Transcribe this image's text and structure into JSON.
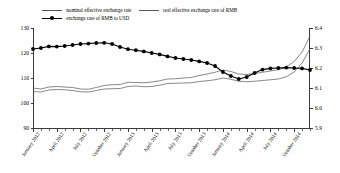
{
  "legend": {
    "items": [
      {
        "label": "nominal effective exchange rate",
        "style": "line",
        "color": "#555555"
      },
      {
        "label": "real effective exchange rate of RMB",
        "style": "line",
        "color": "#555555"
      },
      {
        "label": "exchange rate of RMB to USD",
        "style": "line-marker",
        "color": "#000000"
      }
    ]
  },
  "chart_data": {
    "type": "line",
    "title": "",
    "xlabel": "",
    "ylabel": "",
    "grid": false,
    "legend_position": "top",
    "x": [
      "January 2012",
      "February 2012",
      "March 2012",
      "April 2012",
      "May 2012",
      "June 2012",
      "July 2012",
      "August 2012",
      "September 2012",
      "October 2012",
      "November 2012",
      "December 2012",
      "January 2013",
      "February 2013",
      "March 2013",
      "April 2013",
      "May 2013",
      "June 2013",
      "July 2013",
      "August 2013",
      "September 2013",
      "October 2013",
      "November 2013",
      "December 2013",
      "January 2014",
      "February 2014",
      "March 2014",
      "April 2014",
      "May 2014",
      "June 2014",
      "July 2014",
      "August 2014",
      "September 2014",
      "October 2014",
      "November 2014",
      "December 2014"
    ],
    "xticklabels": [
      "January 2012",
      "April 2012",
      "July 2012",
      "October 2012",
      "January 2013",
      "April 2013",
      "July 2013",
      "October 2013",
      "January 2014",
      "April 2014",
      "July 2014",
      "October 2014"
    ],
    "left_axis": {
      "label": "",
      "ylim": [
        90,
        130
      ],
      "ticks": [
        90,
        100,
        110,
        120,
        130
      ],
      "ticklabels": [
        "90",
        "100",
        "110",
        "120",
        "130"
      ]
    },
    "right_axis": {
      "label": "",
      "ylim": [
        5.9,
        6.4
      ],
      "ticks": [
        5.9,
        6.0,
        6.1,
        6.2,
        6.3,
        6.4
      ],
      "ticklabels": [
        "5.9",
        "6.0",
        "6.1",
        "6.2",
        "6.3",
        "6.4"
      ]
    },
    "series": [
      {
        "name": "nominal effective exchange rate",
        "axis": "left",
        "color": "#555555",
        "marker": "none",
        "values": [
          106.0,
          105.6,
          106.4,
          106.6,
          106.4,
          106.2,
          105.6,
          105.5,
          106.2,
          107.0,
          107.3,
          107.4,
          108.3,
          108.2,
          108.1,
          108.4,
          108.9,
          109.6,
          109.7,
          110.0,
          110.2,
          111.0,
          111.6,
          112.3,
          113.2,
          112.6,
          111.6,
          111.4,
          111.8,
          112.3,
          112.8,
          113.3,
          114.4,
          116.6,
          120.4,
          126.8
        ]
      },
      {
        "name": "real effective exchange rate of RMB",
        "axis": "left",
        "color": "#555555",
        "marker": "none",
        "values": [
          104.6,
          104.4,
          105.2,
          105.4,
          105.3,
          105.0,
          104.5,
          104.4,
          105.0,
          105.6,
          105.7,
          105.8,
          106.6,
          106.8,
          106.5,
          106.6,
          107.1,
          107.8,
          107.9,
          108.0,
          108.1,
          108.6,
          108.9,
          109.3,
          110.0,
          109.5,
          108.7,
          108.5,
          108.7,
          109.0,
          109.3,
          109.6,
          110.5,
          112.4,
          116.0,
          121.8
        ]
      },
      {
        "name": "exchange rate of RMB to USD",
        "axis": "right",
        "color": "#000000",
        "marker": "circle",
        "values": [
          6.295,
          6.3,
          6.308,
          6.307,
          6.31,
          6.315,
          6.32,
          6.322,
          6.325,
          6.326,
          6.32,
          6.305,
          6.294,
          6.289,
          6.283,
          6.275,
          6.268,
          6.258,
          6.25,
          6.245,
          6.24,
          6.233,
          6.225,
          6.21,
          6.18,
          6.16,
          6.145,
          6.155,
          6.175,
          6.192,
          6.198,
          6.2,
          6.202,
          6.2,
          6.198,
          6.19
        ]
      }
    ]
  }
}
